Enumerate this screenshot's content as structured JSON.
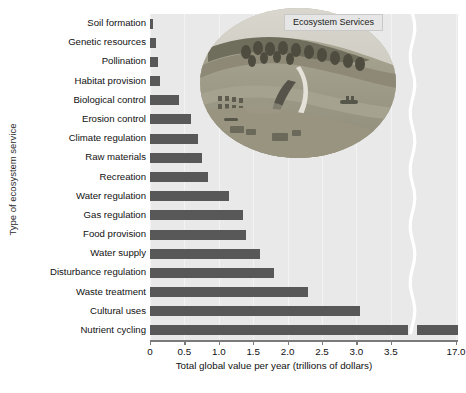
{
  "chart_data": {
    "type": "bar",
    "orientation": "horizontal",
    "title": "",
    "xlabel": "Total global value per year (trillions of dollars)",
    "ylabel": "Type of ecosystem service",
    "xlim": [
      0,
      3.75
    ],
    "xticks": [
      "0",
      "0.5",
      "1.0",
      "1.5",
      "2.0",
      "2.5",
      "3.0",
      "3.5",
      "17.0"
    ],
    "xtick_values": [
      0,
      0.5,
      1.0,
      1.5,
      2.0,
      2.5,
      3.0,
      3.5,
      17.0
    ],
    "axis_break": true,
    "axis_break_note": "Axis is broken between 3.5 and 17.0",
    "grid": true,
    "legend": null,
    "categories": [
      "Soil formation",
      "Genetic resources",
      "Pollination",
      "Habitat provision",
      "Biological control",
      "Erosion control",
      "Climate regulation",
      "Raw materials",
      "Recreation",
      "Water regulation",
      "Gas regulation",
      "Food provision",
      "Water supply",
      "Disturbance regulation",
      "Waste treatment",
      "Cultural uses",
      "Nutrient cycling"
    ],
    "values": [
      0.05,
      0.08,
      0.12,
      0.15,
      0.42,
      0.6,
      0.7,
      0.75,
      0.85,
      1.15,
      1.35,
      1.4,
      1.6,
      1.8,
      2.3,
      3.05,
      17.0
    ],
    "bar_color": "#585858",
    "plot_background": "#e9e9e9"
  },
  "inset": {
    "label": "Ecosystem Services",
    "description": "oval landscape illustration of a river valley with forest, farmland, boats and buildings"
  },
  "caption": {
    "text": ""
  }
}
